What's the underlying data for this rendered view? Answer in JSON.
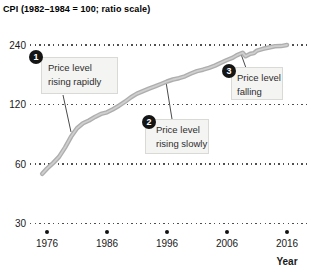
{
  "chart_data": {
    "type": "line",
    "title": "CPI (1982–1984 = 100; ratio scale)",
    "xlabel": "Year",
    "ylabel": "CPI (1982–1984 = 100)",
    "y_scale": "log2 ratio scale",
    "grid": "dotted horizontal gridlines at each y tick",
    "legend": "none",
    "x_ticks": [
      1976,
      1986,
      1996,
      2006,
      2016
    ],
    "y_ticks": [
      240,
      120,
      60,
      30
    ],
    "xlim": [
      1973.2,
      2019.8
    ],
    "ylim": [
      30,
      270
    ],
    "line_color": "#b2b2b2",
    "series": [
      {
        "name": "CPI",
        "points": [
          [
            1975.2,
            53.5
          ],
          [
            1976,
            56.9
          ],
          [
            1977,
            60.6
          ],
          [
            1978,
            65.2
          ],
          [
            1979,
            72.6
          ],
          [
            1980,
            82.4
          ],
          [
            1981,
            90.9
          ],
          [
            1982,
            96.5
          ],
          [
            1983,
            99.6
          ],
          [
            1984,
            103.9
          ],
          [
            1985,
            107.6
          ],
          [
            1986,
            109.6
          ],
          [
            1987,
            113.6
          ],
          [
            1988,
            118.3
          ],
          [
            1989,
            124.0
          ],
          [
            1990,
            130.7
          ],
          [
            1991,
            136.2
          ],
          [
            1992,
            140.3
          ],
          [
            1993,
            144.5
          ],
          [
            1994,
            148.2
          ],
          [
            1995,
            152.4
          ],
          [
            1996,
            156.9
          ],
          [
            1997,
            160.5
          ],
          [
            1998,
            163.0
          ],
          [
            1999,
            166.6
          ],
          [
            2000,
            172.2
          ],
          [
            2001,
            177.1
          ],
          [
            2002,
            179.9
          ],
          [
            2003,
            184.0
          ],
          [
            2004,
            188.9
          ],
          [
            2005,
            195.3
          ],
          [
            2006,
            201.6
          ],
          [
            2007,
            207.3
          ],
          [
            2007.6,
            212.5
          ],
          [
            2008.6,
            219.5
          ],
          [
            2009.1,
            210.5
          ],
          [
            2009.9,
            216.5
          ],
          [
            2010.5,
            218.5
          ],
          [
            2011,
            224.9
          ],
          [
            2012,
            229.6
          ],
          [
            2013,
            233.0
          ],
          [
            2014,
            236.7
          ],
          [
            2015,
            237.0
          ],
          [
            2016,
            240.0
          ]
        ]
      }
    ],
    "annotations": [
      {
        "number": "1",
        "line1": "Price level",
        "line2": "rising rapidly"
      },
      {
        "number": "2",
        "line1": "Price level",
        "line2": "rising slowly"
      },
      {
        "number": "3",
        "line1": "Price level",
        "line2": "falling"
      }
    ]
  }
}
